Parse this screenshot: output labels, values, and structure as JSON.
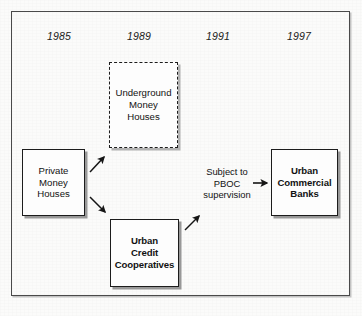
{
  "diagram": {
    "background_color": "#fbfbfa",
    "frame_color": "#4a4a4a",
    "ink_color": "#1c1c1c",
    "timeline": {
      "label": "timeline-years",
      "years": [
        "1985",
        "1989",
        "1991",
        "1997"
      ]
    },
    "nodes": [
      {
        "id": "private-money-houses",
        "text": "Private\nMoney\nHouses",
        "style": "solid",
        "weight": "regular",
        "year": "1985"
      },
      {
        "id": "underground-money-houses",
        "text": "Underground\nMoney\nHouses",
        "style": "dashed",
        "weight": "regular",
        "year": "1989"
      },
      {
        "id": "urban-credit-cooperatives",
        "text": "Urban\nCredit\nCooperatives",
        "style": "solid",
        "weight": "bold",
        "year": "1989"
      },
      {
        "id": "urban-commercial-banks",
        "text": "Urban\nCommercial\nBanks",
        "style": "solid",
        "weight": "bold",
        "year": "1997"
      }
    ],
    "annotations": [
      {
        "id": "pboc-supervision",
        "text": "Subject to\nPBOC\nsupervision",
        "year": "1991"
      }
    ],
    "arrows": [
      {
        "id": "private-to-underground",
        "from": "private-money-houses",
        "to": "underground-money-houses",
        "direction": "up-right"
      },
      {
        "id": "private-to-credit-cooperatives",
        "from": "private-money-houses",
        "to": "urban-credit-cooperatives",
        "direction": "down-right"
      },
      {
        "id": "credit-cooperatives-to-supervision",
        "from": "urban-credit-cooperatives",
        "to": "pboc-supervision",
        "direction": "up-right"
      },
      {
        "id": "supervision-to-commercial-banks",
        "from": "pboc-supervision",
        "to": "urban-commercial-banks",
        "direction": "right"
      }
    ]
  }
}
